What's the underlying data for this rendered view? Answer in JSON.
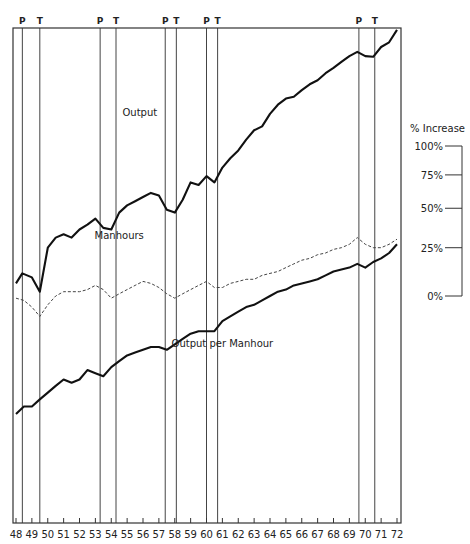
{
  "chart_data": {
    "type": "line",
    "title": "",
    "xlabel": "",
    "ylabel": "% Increase",
    "y_scale": "log",
    "x_range": [
      48,
      72
    ],
    "x_ticks": [
      "48",
      "49",
      "50",
      "51",
      "52",
      "53",
      "54",
      "55",
      "56",
      "57",
      "58",
      "59",
      "60",
      "61",
      "62",
      "63",
      "64",
      "65",
      "66",
      "67",
      "68",
      "69",
      "70",
      "71",
      "72"
    ],
    "scale_bar": {
      "title": "% Increase",
      "ticks": [
        {
          "label": "100%",
          "pct": 100
        },
        {
          "label": "75%",
          "pct": 75
        },
        {
          "label": "50%",
          "pct": 50
        },
        {
          "label": "25%",
          "pct": 25
        },
        {
          "label": "0%",
          "pct": 0
        }
      ]
    },
    "cycle_markers": [
      {
        "label": "P",
        "year": 48.4
      },
      {
        "label": "T",
        "year": 49.5
      },
      {
        "label": "P",
        "year": 53.3
      },
      {
        "label": "T",
        "year": 54.3
      },
      {
        "label": "P",
        "year": 57.4
      },
      {
        "label": "T",
        "year": 58.1
      },
      {
        "label": "P",
        "year": 60.0
      },
      {
        "label": "T",
        "year": 60.7
      },
      {
        "label": "P",
        "year": 69.6
      },
      {
        "label": "T",
        "year": 70.6
      }
    ],
    "series": [
      {
        "name": "Output",
        "style": "solid",
        "label_at": {
          "year": 55.8,
          "value": 230
        },
        "x": [
          48.0,
          48.4,
          49.0,
          49.5,
          50.0,
          50.5,
          51.0,
          51.5,
          52.0,
          52.5,
          53.0,
          53.5,
          54.0,
          54.5,
          55.0,
          55.5,
          56.0,
          56.5,
          57.0,
          57.5,
          58.0,
          58.5,
          59.0,
          59.5,
          60.0,
          60.5,
          61.0,
          61.5,
          62.0,
          62.5,
          63.0,
          63.5,
          64.0,
          64.5,
          65.0,
          65.5,
          66.0,
          66.5,
          67.0,
          67.5,
          68.0,
          68.5,
          69.0,
          69.5,
          70.0,
          70.5,
          71.0,
          71.5,
          72.0
        ],
        "values": [
          106,
          111,
          109,
          102,
          125,
          131,
          133,
          131,
          136,
          139,
          143,
          137,
          136,
          147,
          152,
          155,
          158,
          161,
          159,
          149,
          147,
          156,
          169,
          167,
          174,
          169,
          181,
          189,
          196,
          206,
          215,
          219,
          232,
          242,
          249,
          251,
          259,
          266,
          271,
          280,
          287,
          295,
          303,
          309,
          303,
          302,
          316,
          323,
          342
        ]
      },
      {
        "name": "Manhours",
        "style": "dashed",
        "label_at": {
          "year": 54.5,
          "value": 130
        },
        "x": [
          48.0,
          48.5,
          49.0,
          49.5,
          50.0,
          50.5,
          51.0,
          51.5,
          52.0,
          52.5,
          53.0,
          53.5,
          54.0,
          54.5,
          55.0,
          55.5,
          56.0,
          56.5,
          57.0,
          57.5,
          58.0,
          58.5,
          59.0,
          59.5,
          60.0,
          60.5,
          61.0,
          61.5,
          62.0,
          62.5,
          63.0,
          63.5,
          64.0,
          64.5,
          65.0,
          65.5,
          66.0,
          66.5,
          67.0,
          67.5,
          68.0,
          68.5,
          69.0,
          69.5,
          70.0,
          70.5,
          71.0,
          71.5,
          72.0
        ],
        "values": [
          99,
          98,
          95,
          91,
          96,
          100,
          102,
          102,
          102,
          103,
          105,
          103,
          99,
          101,
          103,
          105,
          107,
          106,
          104,
          101,
          99,
          101,
          103,
          105,
          107,
          104,
          104,
          106,
          107,
          108,
          108,
          110,
          111,
          112,
          114,
          116,
          118,
          119,
          121,
          122,
          124,
          125,
          127,
          131,
          127,
          125,
          125,
          127,
          130
        ]
      },
      {
        "name": "Output per Manhour",
        "style": "solid",
        "label_at": {
          "year": 61.0,
          "value": 79
        },
        "x": [
          48.0,
          48.5,
          49.0,
          49.5,
          50.0,
          50.5,
          51.0,
          51.5,
          52.0,
          52.5,
          53.0,
          53.5,
          54.0,
          54.5,
          55.0,
          55.5,
          56.0,
          56.5,
          57.0,
          57.5,
          58.0,
          58.5,
          59.0,
          59.5,
          60.0,
          60.5,
          61.0,
          61.5,
          62.0,
          62.5,
          63.0,
          63.5,
          64.0,
          64.5,
          65.0,
          65.5,
          66.0,
          66.5,
          67.0,
          67.5,
          68.0,
          68.5,
          69.0,
          69.5,
          70.0,
          70.5,
          71.0,
          71.5,
          72.0
        ],
        "values": [
          58,
          60,
          60,
          62,
          64,
          66,
          68,
          67,
          68,
          71,
          70,
          69,
          72,
          74,
          76,
          77,
          78,
          79,
          79,
          78,
          80,
          82,
          84,
          85,
          85,
          85,
          89,
          91,
          93,
          95,
          96,
          98,
          100,
          102,
          103,
          105,
          106,
          107,
          108,
          110,
          112,
          113,
          114,
          116,
          114,
          117,
          119,
          122,
          127
        ]
      }
    ]
  }
}
